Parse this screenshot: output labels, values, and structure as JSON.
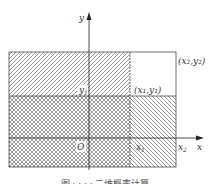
{
  "figure": {
    "labels": {
      "y_axis": "y",
      "x_axis": "x",
      "origin": "O",
      "x1": "x",
      "x1_sub": "1",
      "x2": "x",
      "x2_sub": "2",
      "y1": "y",
      "y1_sub": "1",
      "point1": "(x₁,y₁)",
      "point2": "(x₂,y₂)"
    },
    "caption": "图 · · · · 二维概率计算",
    "colors": {
      "line": "#333333",
      "hatch": "#555555",
      "background": "#ffffff"
    }
  }
}
